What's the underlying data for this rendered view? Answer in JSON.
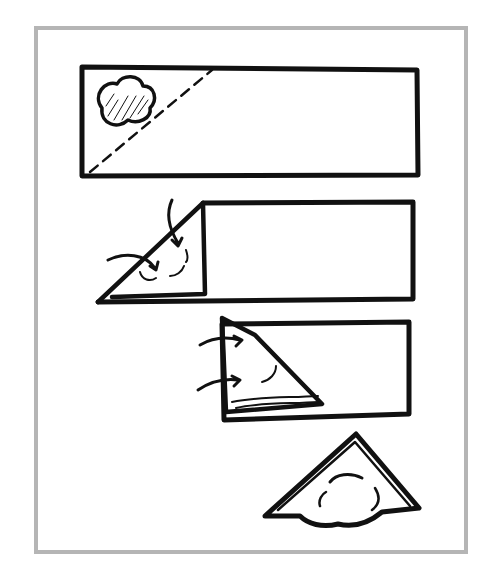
{
  "illustration": {
    "type": "folding-instructions",
    "subject": "triangle dumpling / samosa folding",
    "frame_color": "#b5b5b5",
    "ink_color": "#111111",
    "steps": [
      {
        "index": 1,
        "description": "Dough strip with filling in corner and dashed diagonal fold line"
      },
      {
        "index": 2,
        "description": "Corner folded over filling into triangle, arrows indicating fold"
      },
      {
        "index": 3,
        "description": "Triangle folded again along strip, arrows indicating fold"
      },
      {
        "index": 4,
        "description": "Finished triangular pastry"
      }
    ]
  }
}
